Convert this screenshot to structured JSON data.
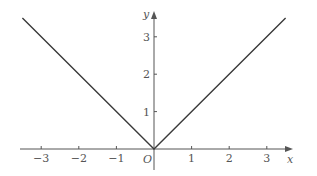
{
  "chart_data": {
    "type": "line",
    "title": "",
    "function": "y = |x|",
    "xlabel": "x",
    "ylabel": "y",
    "origin_label": "O",
    "xlim": [
      -3.5,
      3.5
    ],
    "ylim": [
      0,
      3.5
    ],
    "grid": false,
    "legend": null,
    "x_ticks": [
      -3,
      -2,
      -1,
      1,
      2,
      3
    ],
    "x_tick_labels": [
      "−3",
      "−2",
      "−1",
      "1",
      "2",
      "3"
    ],
    "y_ticks": [
      1,
      2,
      3
    ],
    "y_tick_labels": [
      "1",
      "2",
      "3"
    ],
    "series": [
      {
        "name": "y = |x|",
        "x": [
          -3.5,
          0,
          3.5
        ],
        "y": [
          3.5,
          0,
          3.5
        ]
      }
    ]
  },
  "colors": {
    "line": "#3a3a3a",
    "axis": "#555555",
    "text": "#555555"
  }
}
